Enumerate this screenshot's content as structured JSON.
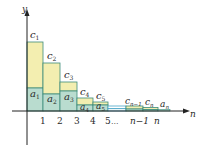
{
  "diagram": {
    "axes": {
      "x_label": "n",
      "y_label": "y",
      "x_ticks": [
        "1",
        "2",
        "3",
        "4",
        "5",
        "...",
        "n−1",
        "n"
      ]
    },
    "colors": {
      "upper_fill": "#f3eeb0",
      "lower_fill": "#b9dccf",
      "bar_stroke": "#3c8c7a",
      "axis": "#222222",
      "gap_stroke": "#4aa6c8"
    },
    "bars": [
      {
        "c_label": "c",
        "c_sub": "1",
        "a_label": "a",
        "a_sub": "1"
      },
      {
        "c_label": "c",
        "c_sub": "2",
        "a_label": "a",
        "a_sub": "2"
      },
      {
        "c_label": "c",
        "c_sub": "3",
        "a_label": "a",
        "a_sub": "3"
      },
      {
        "c_label": "c",
        "c_sub": "4",
        "a_label": "a",
        "a_sub": "4"
      },
      {
        "c_label": "c",
        "c_sub": "5",
        "a_label": "a",
        "a_sub": "5"
      },
      {
        "c_label": "c",
        "c_sub": "n−1"
      },
      {
        "c_label": "c",
        "c_sub": "n",
        "a_label": "a",
        "a_sub": "n"
      }
    ]
  }
}
